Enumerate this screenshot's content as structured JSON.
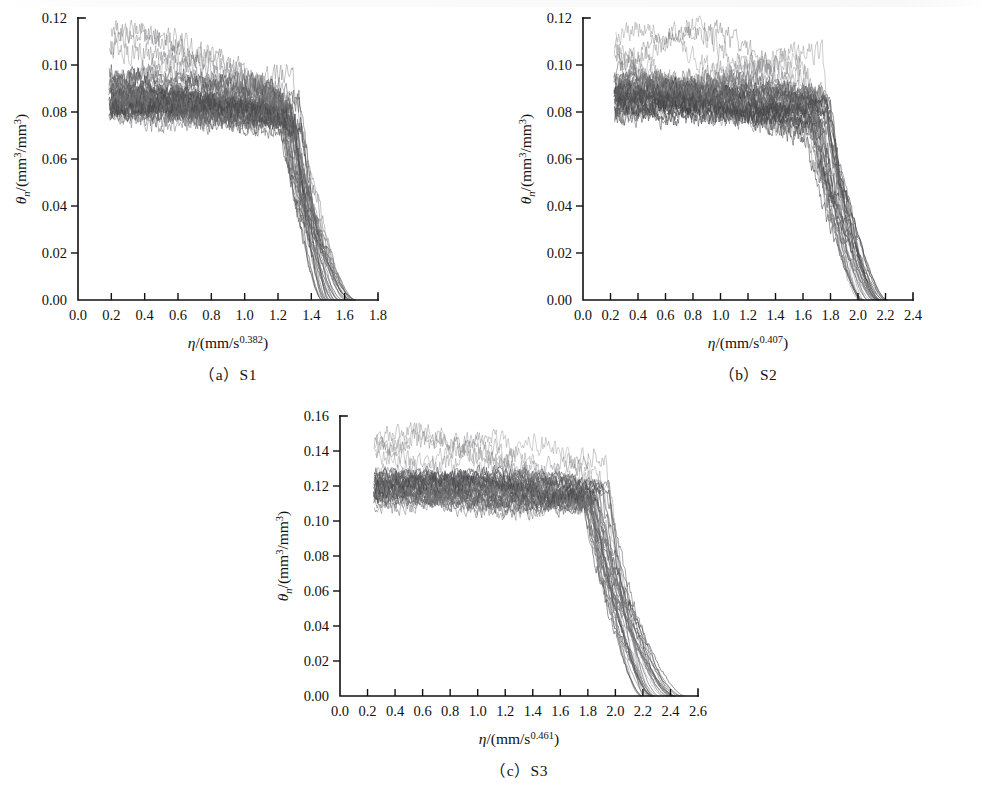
{
  "figure": {
    "type": "multi-panel-line-chart",
    "panel_count": 3,
    "background": "#ffffff",
    "ink_color": "#111111"
  },
  "chart_data": [
    {
      "id": "panel-a",
      "type": "line",
      "title": "",
      "caption": "（a）S1",
      "caption_label": "(a)",
      "caption_name": "S1",
      "xlabel_pre": "η",
      "xlabel_mid": "/(mm/s",
      "xlabel_exp": "0.382",
      "xlabel_post": ")",
      "ylabel_pre": "θ",
      "ylabel_sub": "n",
      "ylabel_mid": "/(mm",
      "ylabel_exp1": "3",
      "ylabel_mid2": "/mm",
      "ylabel_exp2": "3",
      "ylabel_post": ")",
      "xlim": [
        0.0,
        1.8
      ],
      "ylim": [
        0.0,
        0.12
      ],
      "xticks": [
        0.0,
        0.2,
        0.4,
        0.6,
        0.8,
        1.0,
        1.2,
        1.4,
        1.6,
        1.8
      ],
      "xticklabels": [
        "0.0",
        "0.2",
        "0.4",
        "0.6",
        "0.8",
        "1.0",
        "1.2",
        "1.4",
        "1.6",
        "1.8"
      ],
      "yticks": [
        0.0,
        0.02,
        0.04,
        0.06,
        0.08,
        0.1,
        0.12
      ],
      "yticklabels": [
        "0.00",
        "0.02",
        "0.04",
        "0.06",
        "0.08",
        "0.10",
        "0.12"
      ],
      "grid": false,
      "legend": "none",
      "series_count": 40,
      "profile": {
        "description": "Bundle of ~40 noisy moisture profiles: plateau near 0.085 then sharp drop to zero at the wetting front.",
        "x_start": 0.19,
        "plateau_level": 0.085,
        "plateau_top": 0.1,
        "plateau_bottom": 0.073,
        "upper_outliers_top": 0.108,
        "knee_x": 1.28,
        "front_x_min": 1.46,
        "front_x_max": 1.67,
        "noise_amplitude": 0.006
      }
    },
    {
      "id": "panel-b",
      "type": "line",
      "title": "",
      "caption": "（b）S2",
      "caption_label": "(b)",
      "caption_name": "S2",
      "xlabel_pre": "η",
      "xlabel_mid": "/(mm/s",
      "xlabel_exp": "0.407",
      "xlabel_post": ")",
      "ylabel_pre": "θ",
      "ylabel_sub": "n",
      "ylabel_mid": "/(mm",
      "ylabel_exp1": "3",
      "ylabel_mid2": "/mm",
      "ylabel_exp2": "3",
      "ylabel_post": ")",
      "xlim": [
        0.0,
        2.4
      ],
      "ylim": [
        0.0,
        0.12
      ],
      "xticks": [
        0.0,
        0.2,
        0.4,
        0.6,
        0.8,
        1.0,
        1.2,
        1.4,
        1.6,
        1.8,
        2.0,
        2.2,
        2.4
      ],
      "xticklabels": [
        "0.0",
        "0.2",
        "0.4",
        "0.6",
        "0.8",
        "1.0",
        "1.2",
        "1.4",
        "1.6",
        "1.8",
        "2.0",
        "2.2",
        "2.4"
      ],
      "yticks": [
        0.0,
        0.02,
        0.04,
        0.06,
        0.08,
        0.1,
        0.12
      ],
      "yticklabels": [
        "0.00",
        "0.02",
        "0.04",
        "0.06",
        "0.08",
        "0.10",
        "0.12"
      ],
      "grid": false,
      "legend": "none",
      "series_count": 40,
      "profile": {
        "description": "Bundle of ~40 noisy moisture profiles: flat plateau near 0.085 then steep drop at the wetting front.",
        "x_start": 0.23,
        "plateau_level": 0.085,
        "plateau_top": 0.098,
        "plateau_bottom": 0.075,
        "upper_outliers_top": 0.11,
        "knee_x": 1.7,
        "front_x_min": 2.0,
        "front_x_max": 2.22,
        "noise_amplitude": 0.006
      }
    },
    {
      "id": "panel-c",
      "type": "line",
      "title": "",
      "caption": "（c）S3",
      "caption_label": "(c)",
      "caption_name": "S3",
      "xlabel_pre": "η",
      "xlabel_mid": "/(mm/s",
      "xlabel_exp": "0.461",
      "xlabel_post": ")",
      "ylabel_pre": "θ",
      "ylabel_sub": "n",
      "ylabel_mid": "/(mm",
      "ylabel_exp1": "3",
      "ylabel_mid2": "/mm",
      "ylabel_exp2": "3",
      "ylabel_post": ")",
      "xlim": [
        0.0,
        2.6
      ],
      "ylim": [
        0.0,
        0.16
      ],
      "xticks": [
        0.0,
        0.2,
        0.4,
        0.6,
        0.8,
        1.0,
        1.2,
        1.4,
        1.6,
        1.8,
        2.0,
        2.2,
        2.4,
        2.6
      ],
      "xticklabels": [
        "0.0",
        "0.2",
        "0.4",
        "0.6",
        "0.8",
        "1.0",
        "1.2",
        "1.4",
        "1.6",
        "1.8",
        "2.0",
        "2.2",
        "2.4",
        "2.6"
      ],
      "yticks": [
        0.0,
        0.02,
        0.04,
        0.06,
        0.08,
        0.1,
        0.12,
        0.14,
        0.16
      ],
      "yticklabels": [
        "0.00",
        "0.02",
        "0.04",
        "0.06",
        "0.08",
        "0.10",
        "0.12",
        "0.14",
        "0.16"
      ],
      "grid": false,
      "legend": "none",
      "series_count": 40,
      "profile": {
        "description": "Bundle of ~40 noisy moisture profiles: plateau near 0.118 then drop to zero at the wetting front.",
        "x_start": 0.25,
        "plateau_level": 0.118,
        "plateau_top": 0.132,
        "plateau_bottom": 0.105,
        "upper_outliers_top": 0.148,
        "knee_x": 1.85,
        "front_x_min": 2.18,
        "front_x_max": 2.52,
        "noise_amplitude": 0.007
      }
    }
  ]
}
